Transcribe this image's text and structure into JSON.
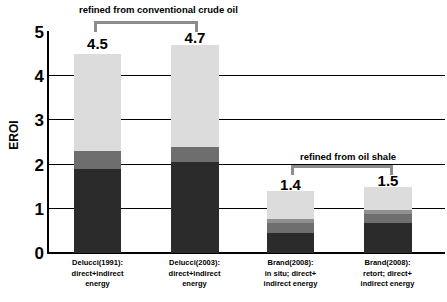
{
  "chart_data": {
    "type": "bar",
    "subtype": "stacked-bar",
    "title": "",
    "xlabel": "",
    "ylabel": "EROI",
    "ylim": [
      0,
      5
    ],
    "yticks": [
      0,
      1,
      2,
      3,
      4,
      5
    ],
    "grid": true,
    "legend": "none",
    "categories": [
      "Delucci(1991): direct+indirect energy",
      "Delucci(2003): direct+indirect energy",
      "Brand(2008): in situ; direct+ indirect energy",
      "Brand(2008): retort; direct+ indirect energy"
    ],
    "totals": [
      4.5,
      4.7,
      1.4,
      1.5
    ],
    "series": [
      {
        "name": "segment-1-dark",
        "color": "#2b2b2b",
        "values": [
          1.9,
          2.05,
          0.45,
          0.67
        ]
      },
      {
        "name": "segment-2-mid-gray",
        "color": "#6e6e6e",
        "values": [
          0.4,
          0.35,
          0.23,
          0.21
        ]
      },
      {
        "name": "segment-3-light-gray",
        "color": "#8f8f8f",
        "values": [
          0.0,
          0.0,
          0.1,
          0.09
        ]
      },
      {
        "name": "segment-4-pale",
        "color": "#dcdcdc",
        "values": [
          2.2,
          2.3,
          0.62,
          0.53
        ]
      }
    ]
  },
  "yaxis": {
    "title": "EROI",
    "ticks": [
      "5",
      "4",
      "3",
      "2",
      "1",
      "0"
    ]
  },
  "bars": [
    {
      "value_label": "4.5",
      "category_lines": [
        "Delucci(1991):",
        "direct+indirect",
        "energy"
      ]
    },
    {
      "value_label": "4.7",
      "category_lines": [
        "Delucci(2003):",
        "direct+indirect",
        "energy"
      ]
    },
    {
      "value_label": "1.4",
      "category_lines": [
        "Brand(2008):",
        "in situ; direct+",
        "indirect energy"
      ]
    },
    {
      "value_label": "1.5",
      "category_lines": [
        "Brand(2008):",
        "retort; direct+",
        "indirect energy"
      ]
    }
  ],
  "annotations": [
    {
      "text": "refined from conventional crude oil"
    },
    {
      "text": "refined from oil shale"
    }
  ],
  "colors": {
    "segment_dark": "#2b2b2b",
    "segment_mid": "#6e6e6e",
    "segment_light": "#8f8f8f",
    "segment_pale": "#dcdcdc",
    "bracket": "#8c8c8c",
    "axis": "#000000",
    "background": "#ffffff"
  }
}
